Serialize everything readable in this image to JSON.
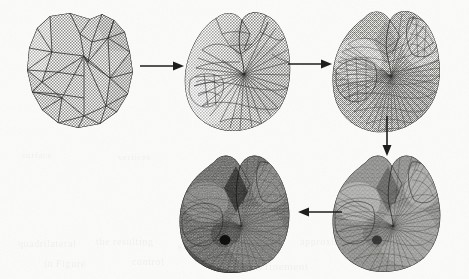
{
  "figure": {
    "background_color": "#fbfbfa",
    "ink_color": "#2a2a2a",
    "width": 469,
    "height": 279,
    "medium": "scanned halftone print",
    "flow": "serpentine: top row left-to-right, then down, then bottom row right-to-left"
  },
  "stages": [
    {
      "id": "stage-1",
      "label": "coarse control mesh",
      "density": "coarse",
      "approx_faces": 60,
      "fill_tone": "#b9b9b7",
      "edge_opacity": 0.95,
      "edge_width": 0.8,
      "subdivision_level": 0,
      "x": 22,
      "y": 12,
      "w": 118,
      "h": 118
    },
    {
      "id": "stage-2",
      "label": "first subdivision",
      "density": "medium",
      "approx_faces": 240,
      "fill_tone": "#b4b4b1",
      "edge_opacity": 0.8,
      "edge_width": 0.55,
      "subdivision_level": 1,
      "x": 182,
      "y": 10,
      "w": 118,
      "h": 122
    },
    {
      "id": "stage-3",
      "label": "second subdivision",
      "density": "fine",
      "approx_faces": 960,
      "fill_tone": "#a8a8a5",
      "edge_opacity": 0.6,
      "edge_width": 0.4,
      "subdivision_level": 2,
      "x": 330,
      "y": 8,
      "w": 118,
      "h": 122
    },
    {
      "id": "stage-4",
      "label": "third subdivision",
      "density": "very fine",
      "approx_faces": 3840,
      "fill_tone": "#8d8d8a",
      "edge_opacity": 0.45,
      "edge_width": 0.3,
      "subdivision_level": 3,
      "x": 330,
      "y": 152,
      "w": 120,
      "h": 120
    },
    {
      "id": "stage-5",
      "label": "limit surface",
      "density": "dense",
      "approx_faces": 15360,
      "fill_tone": "#5d5d5a",
      "edge_opacity": 0.35,
      "edge_width": 0.25,
      "subdivision_level": 4,
      "x": 176,
      "y": 150,
      "w": 124,
      "h": 124
    }
  ],
  "arrows": [
    {
      "id": "arrow-1",
      "direction": "right",
      "from": "stage-1",
      "to": "stage-2",
      "x": 140,
      "y": 66,
      "length": 44
    },
    {
      "id": "arrow-2",
      "direction": "right",
      "from": "stage-2",
      "to": "stage-3",
      "x": 288,
      "y": 64,
      "length": 44
    },
    {
      "id": "arrow-3",
      "direction": "down",
      "from": "stage-3",
      "to": "stage-4",
      "x": 386,
      "y": 116,
      "length": 40
    },
    {
      "id": "arrow-4",
      "direction": "left",
      "from": "stage-4",
      "to": "stage-5",
      "x": 296,
      "y": 212,
      "length": 44
    }
  ],
  "bleed_text": [
    {
      "text": "quadrilateral",
      "x": 18,
      "y": 238,
      "size": 10
    },
    {
      "text": "the resulting",
      "x": 96,
      "y": 236,
      "size": 10
    },
    {
      "text": "subdivision surface",
      "x": 178,
      "y": 240,
      "size": 11
    },
    {
      "text": "approximation of",
      "x": 300,
      "y": 236,
      "size": 10
    },
    {
      "text": "in Figure",
      "x": 44,
      "y": 258,
      "size": 10
    },
    {
      "text": "control",
      "x": 132,
      "y": 256,
      "size": 10
    },
    {
      "text": "mesh refinement",
      "x": 226,
      "y": 260,
      "size": 11
    },
    {
      "text": "limit",
      "x": 362,
      "y": 256,
      "size": 10
    },
    {
      "text": "surface",
      "x": 22,
      "y": 150,
      "size": 9
    },
    {
      "text": "vertices",
      "x": 118,
      "y": 152,
      "size": 9
    }
  ]
}
